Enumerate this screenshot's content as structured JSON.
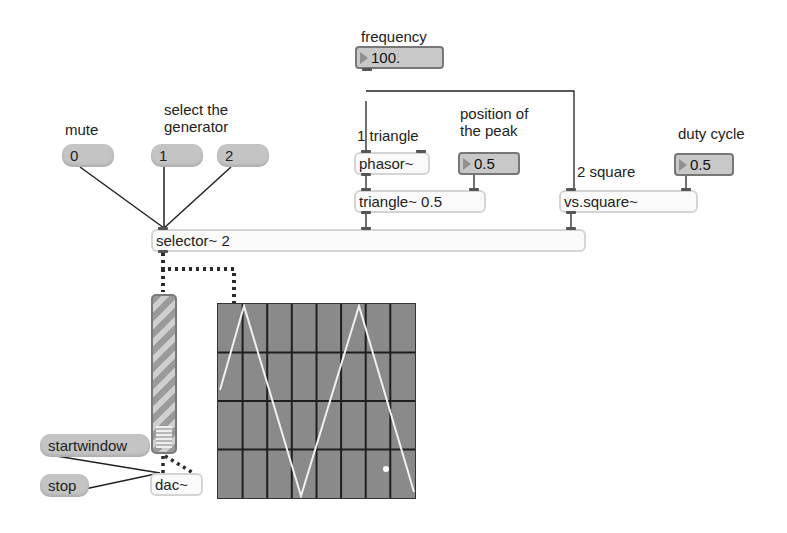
{
  "comments": {
    "frequency": "frequency",
    "mute": "mute",
    "select_generator": "select the\ngenerator",
    "triangle_label": "1 triangle",
    "peak_position": "position of\nthe peak",
    "square_label": "2 square",
    "duty_cycle": "duty cycle"
  },
  "number_boxes": {
    "frequency": "100.",
    "peak_position": "0.5",
    "duty_cycle": "0.5"
  },
  "messages": {
    "mute": "0",
    "gen1": "1",
    "gen2": "2",
    "startwindow": "startwindow",
    "stop": "stop"
  },
  "objects": {
    "phasor": "phasor~",
    "triangle": "triangle~ 0.5",
    "square": "vs.square~",
    "selector": "selector~ 2",
    "dac": "dac~"
  },
  "scope": {
    "background": "#8a8a8a",
    "grid_color": "#1e1e1e",
    "trace_color": "#f0f0f0",
    "grid_columns": 8,
    "grid_rows": 4
  },
  "meter": {
    "level_label": "signal level meter"
  }
}
